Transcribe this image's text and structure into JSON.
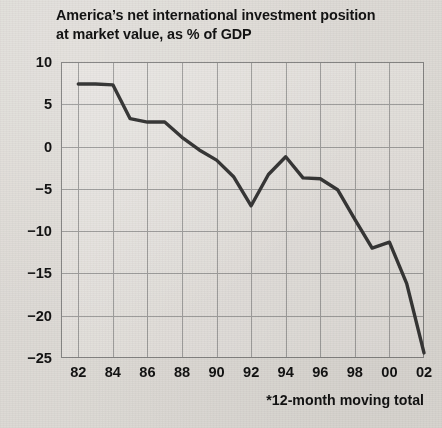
{
  "title": {
    "line1": "America’s net international investment position",
    "line2": "at market value, as % of GDP"
  },
  "footnote": "*12-month moving total",
  "colors": {
    "background": "#eceae7",
    "line": "#3a3a3a",
    "grid": "#a9a9a9",
    "frame": "#8d8d8d",
    "text": "#141414"
  },
  "chart_data": {
    "type": "line",
    "title": "America’s net international investment position at market value, as % of GDP",
    "subtitle": "",
    "xlabel": "",
    "ylabel": "",
    "annotations": [
      "*12-month moving total"
    ],
    "legend": [],
    "legend_position": "none",
    "grid": true,
    "xlim": [
      1981,
      2002
    ],
    "ylim": [
      -25,
      10
    ],
    "yticks": [
      10,
      5,
      0,
      -5,
      -10,
      -15,
      -20,
      -25
    ],
    "ytick_labels": [
      "10",
      "5",
      "0",
      "−5",
      "−10",
      "−15",
      "−20",
      "−25"
    ],
    "xticks": [
      1982,
      1984,
      1986,
      1988,
      1990,
      1992,
      1994,
      1996,
      1998,
      2000,
      2002
    ],
    "xtick_labels": [
      "82",
      "84",
      "86",
      "88",
      "90",
      "92",
      "94",
      "96",
      "98",
      "00",
      "02"
    ],
    "x": [
      1982,
      1983,
      1984,
      1985,
      1986,
      1987,
      1988,
      1989,
      1990,
      1991,
      1992,
      1993,
      1994,
      1995,
      1996,
      1997,
      1998,
      1999,
      2000,
      2001,
      2002
    ],
    "series": [
      {
        "name": "Net international investment position (% of GDP)",
        "values": [
          7.4,
          7.4,
          7.3,
          3.3,
          2.9,
          2.9,
          1.1,
          -0.4,
          -1.6,
          -3.6,
          -7.0,
          -3.3,
          -1.2,
          -3.7,
          -3.8,
          -5.1,
          -8.6,
          -12.0,
          -11.3,
          -16.2,
          -24.4
        ]
      }
    ]
  }
}
